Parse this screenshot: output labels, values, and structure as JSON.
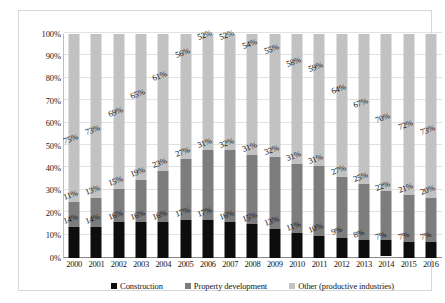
{
  "chart_data": {
    "type": "bar",
    "subtype": "100% stacked column",
    "title": "",
    "subtitle": "",
    "xlabel": "",
    "ylabel": "",
    "ylim": [
      0,
      100
    ],
    "y_unit": "%",
    "grid": true,
    "legend_position": "bottom",
    "categories": [
      "2000",
      "2001",
      "2002",
      "2003",
      "2004",
      "2005",
      "2006",
      "2007",
      "2008",
      "2009",
      "2010",
      "2011",
      "2012",
      "2013",
      "2014",
      "2015",
      "2016"
    ],
    "y_ticks": [
      "0%",
      "10%",
      "20%",
      "30%",
      "40%",
      "50%",
      "60%",
      "70%",
      "80%",
      "90%",
      "100%"
    ],
    "series": [
      {
        "name": "Construction",
        "color": "#0d0d0d",
        "values": [
          14,
          14,
          16,
          16,
          16,
          17,
          17,
          16,
          15,
          13,
          11,
          10,
          9,
          8,
          7,
          7,
          7
        ],
        "labels": [
          "14%",
          "14%",
          "16%",
          "16%",
          "16%",
          "17%",
          "17%",
          "16%",
          "15%",
          "13%",
          "11%",
          "10%",
          "9%",
          "8%",
          "7%",
          "7%",
          "7%"
        ]
      },
      {
        "name": "Property development",
        "color": "#7d7d7d",
        "values": [
          11,
          13,
          15,
          19,
          23,
          27,
          31,
          32,
          31,
          32,
          31,
          31,
          27,
          25,
          22,
          21,
          20
        ],
        "labels": [
          "11%",
          "13%",
          "15%",
          "19%",
          "23%",
          "27%",
          "31%",
          "32%",
          "31%",
          "32%",
          "31%",
          "31%",
          "27%",
          "25%",
          "22%",
          "21%",
          "20%"
        ]
      },
      {
        "name": "Other (productive industries)",
        "color": "#c2c2c2",
        "values": [
          75,
          73,
          69,
          65,
          61,
          56,
          52,
          52,
          54,
          55,
          58,
          59,
          64,
          67,
          70,
          72,
          73
        ],
        "labels": [
          "75%",
          "73%",
          "69%",
          "65%",
          "61%",
          "56%",
          "52%",
          "52%",
          "54%",
          "55%",
          "58%",
          "59%",
          "64%",
          "67%",
          "70%",
          "72%",
          "73%"
        ]
      }
    ]
  },
  "legend": {
    "items": [
      {
        "label": "Construction",
        "color": "#0d0d0d"
      },
      {
        "label": "Property development",
        "color": "#7d7d7d"
      },
      {
        "label": "Other (productive industries)",
        "color": "#c2c2c2"
      }
    ]
  }
}
